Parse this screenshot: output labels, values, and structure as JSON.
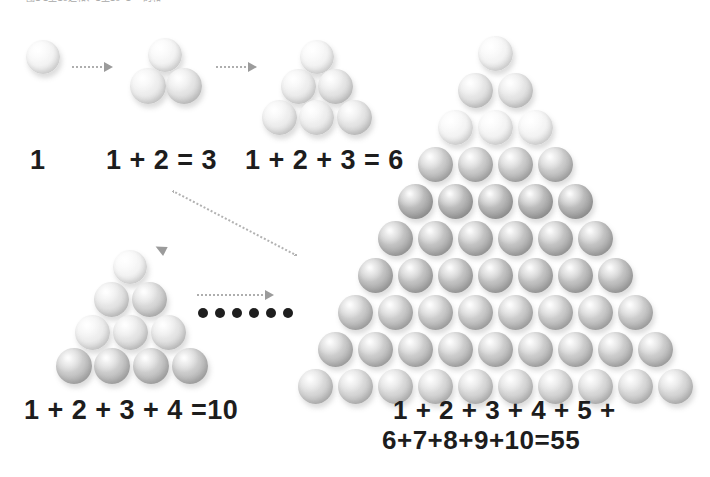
{
  "header": {
    "clipped_text": "图1 1至10之和、1至10+1 ─ 的和"
  },
  "diagram": {
    "captions": {
      "group1": "1",
      "group2": "1 + 2 = 3",
      "group3": "1 + 2 + 3 = 6",
      "group4": "1 + 2 + 3 + 4 =10",
      "group5_line1": "1 + 2 + 3 + 4 + 5 +",
      "group5_line2": "6+7+8+9+10=55"
    },
    "ellipsis_dot_count": 6,
    "colors": {
      "background": "#ffffff",
      "caption_text": "#1d1d1d",
      "arrow": "#9b9b9b",
      "arrow_dotted": "#aeaeae",
      "ellipsis_dot": "#1e1e1e",
      "sphere_light": "#f3f3f3",
      "sphere_mid": "#c6c6c6",
      "sphere_dark": "#949494"
    },
    "groups": [
      {
        "name": "group-1",
        "rows": 1,
        "sphere_count": 1,
        "sum": 1,
        "spheres": [
          {
            "x": 26,
            "y": 40,
            "d": 34,
            "tone": "t-lightest"
          }
        ]
      },
      {
        "name": "group-2",
        "rows": 2,
        "sphere_count": 3,
        "sum": 3,
        "spheres": [
          {
            "x": 148,
            "y": 38,
            "d": 34,
            "tone": "t-lightest"
          },
          {
            "x": 130,
            "y": 68,
            "d": 36,
            "tone": "t-light"
          },
          {
            "x": 166,
            "y": 68,
            "d": 36,
            "tone": "t-mid"
          }
        ]
      },
      {
        "name": "group-3",
        "rows": 3,
        "sphere_count": 6,
        "sum": 6,
        "spheres": [
          {
            "x": 300,
            "y": 40,
            "d": 34,
            "tone": "t-lightest"
          },
          {
            "x": 281,
            "y": 69,
            "d": 35,
            "tone": "t-light"
          },
          {
            "x": 318,
            "y": 69,
            "d": 35,
            "tone": "t-mid"
          },
          {
            "x": 262,
            "y": 100,
            "d": 35,
            "tone": "t-light"
          },
          {
            "x": 299,
            "y": 100,
            "d": 35,
            "tone": "t-light"
          },
          {
            "x": 337,
            "y": 100,
            "d": 35,
            "tone": "t-mid"
          }
        ]
      },
      {
        "name": "group-4",
        "rows": 4,
        "sphere_count": 10,
        "sum": 10,
        "spheres": [
          {
            "x": 113,
            "y": 250,
            "d": 34,
            "tone": "t-lightest"
          },
          {
            "x": 94,
            "y": 282,
            "d": 35,
            "tone": "t-mid"
          },
          {
            "x": 132,
            "y": 282,
            "d": 35,
            "tone": "t-midgray"
          },
          {
            "x": 75,
            "y": 315,
            "d": 35,
            "tone": "t-light"
          },
          {
            "x": 113,
            "y": 315,
            "d": 35,
            "tone": "t-mid"
          },
          {
            "x": 151,
            "y": 315,
            "d": 35,
            "tone": "t-mid"
          },
          {
            "x": 56,
            "y": 348,
            "d": 36,
            "tone": "t-gray"
          },
          {
            "x": 94,
            "y": 348,
            "d": 36,
            "tone": "t-gray"
          },
          {
            "x": 133,
            "y": 348,
            "d": 36,
            "tone": "t-gray"
          },
          {
            "x": 172,
            "y": 348,
            "d": 36,
            "tone": "t-gray"
          }
        ]
      },
      {
        "name": "group-5",
        "rows": 10,
        "sphere_count": 55,
        "sum": 55,
        "row_counts": [
          1,
          2,
          3,
          4,
          5,
          6,
          7,
          8,
          9,
          10
        ],
        "geometry": {
          "apex_center_x": 495,
          "top_y": 36,
          "row_step_y": 37,
          "col_step_x": 40,
          "diameter": 35
        },
        "row_tones": [
          "t-lightest",
          "t-mid",
          "t-lightest",
          "t-gray",
          "t-darker",
          "t-dark",
          "t-dark",
          "t-gray",
          "t-gray",
          "t-midgray"
        ]
      }
    ]
  }
}
